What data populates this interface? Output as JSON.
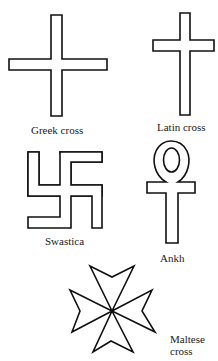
{
  "figure": {
    "colors": {
      "stroke": "#111111",
      "background": "#ffffff",
      "text": "#1a1a1a"
    },
    "items": [
      {
        "id": "greek-cross",
        "label": "Greek cross"
      },
      {
        "id": "latin-cross",
        "label": "Latin cross"
      },
      {
        "id": "swastica",
        "label": "Swastica"
      },
      {
        "id": "ankh",
        "label": "Ankh"
      },
      {
        "id": "maltese-cross",
        "label_line1": "Maltese",
        "label_line2": "cross"
      }
    ]
  }
}
